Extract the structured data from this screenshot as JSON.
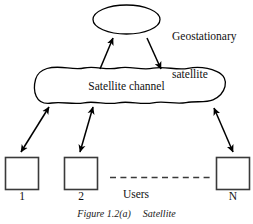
{
  "figure": {
    "caption_number": "Figure 1.2(a)",
    "caption_title": "Satellite",
    "background_color": "#ffffff",
    "stroke_color": "#000000"
  },
  "nodes": {
    "satellite": {
      "shape": "ellipse",
      "label_line1": "Geostationary",
      "label_line2": "satellite"
    },
    "channel": {
      "shape": "cloud",
      "label": "Satellite channel"
    },
    "users_group_label": "Users",
    "user_boxes": [
      {
        "name": "user-box-1",
        "label": "1"
      },
      {
        "name": "user-box-2",
        "label": "2"
      },
      {
        "name": "user-box-n",
        "label": "N"
      }
    ],
    "continuation": {
      "style": "dashed-line",
      "meaning": "additional users omitted"
    }
  },
  "links": [
    {
      "name": "uplink-arrow",
      "from": "channel",
      "to": "satellite",
      "heads": 1,
      "direction": "up"
    },
    {
      "name": "downlink-arrow",
      "from": "satellite",
      "to": "channel",
      "heads": 1,
      "direction": "down"
    },
    {
      "name": "user1-channel-arrow",
      "from": "user-box-1",
      "to": "channel",
      "heads": 2,
      "direction": "bidirectional"
    },
    {
      "name": "user2-channel-arrow",
      "from": "user-box-2",
      "to": "channel",
      "heads": 2,
      "direction": "bidirectional"
    },
    {
      "name": "usern-channel-arrow",
      "from": "user-box-n",
      "to": "channel",
      "heads": 2,
      "direction": "bidirectional"
    }
  ]
}
